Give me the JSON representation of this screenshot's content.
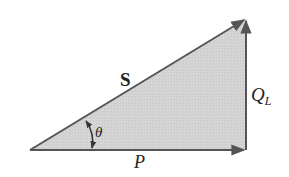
{
  "diagram": {
    "colors": {
      "fill": "#d3d3d3",
      "stroke": "#555555",
      "text": "#222222"
    },
    "labels": {
      "hypotenuse": "S",
      "vertical": "Q",
      "vertical_sub": "L",
      "horizontal": "P",
      "angle": "θ"
    },
    "vertices": {
      "origin": [
        30,
        150
      ],
      "right": [
        246,
        150
      ],
      "apex": [
        246,
        19
      ]
    }
  }
}
